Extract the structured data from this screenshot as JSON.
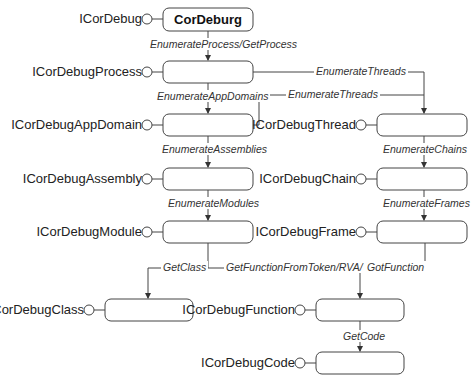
{
  "diagram": {
    "root": {
      "label": "CorDeburg",
      "interface": "ICorDebug"
    },
    "objects": [
      {
        "id": "process",
        "interface": "ICorDebugProcess"
      },
      {
        "id": "appdomain",
        "interface": "ICorDebugAppDomain"
      },
      {
        "id": "assembly",
        "interface": "ICorDebugAssembly"
      },
      {
        "id": "module",
        "interface": "ICorDebugModule"
      },
      {
        "id": "thread",
        "interface": "ICorDebugThread"
      },
      {
        "id": "chain",
        "interface": "ICorDebugChain"
      },
      {
        "id": "frame",
        "interface": "ICorDebugFrame"
      },
      {
        "id": "class",
        "interface": "ICorDebugClass"
      },
      {
        "id": "function",
        "interface": "ICorDebugFunction"
      },
      {
        "id": "code",
        "interface": "ICorDebugCode"
      }
    ],
    "edges": {
      "root_to_process": "EnumerateProcess/GetProcess",
      "process_to_appdomain": "EnumerateAppDomains",
      "process_to_thread": "EnumerateThreads",
      "appdomain_to_thread": "EnumerateThreads",
      "appdomain_to_assembly": "EnumerateAssemblies",
      "assembly_to_module": "EnumerateModules",
      "thread_to_chain": "EnumerateChains",
      "chain_to_frame": "EnumerateFrames",
      "module_to_class": "GetClass",
      "module_to_function": "GetFunctionFromToken/RVA/",
      "frame_to_function": "GotFunction",
      "function_to_code": "GetCode"
    }
  }
}
